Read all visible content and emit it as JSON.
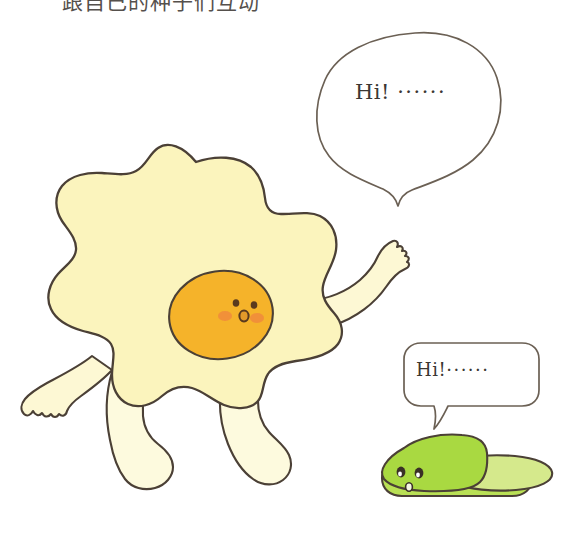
{
  "page": {
    "background_color": "#ffffff",
    "width": 581,
    "height": 534
  },
  "caption": {
    "text": "跟自己的种子们互动",
    "note": "clipped line of text along the very top edge, only the lower strokes are visible"
  },
  "speech_bubbles": [
    {
      "id": "big",
      "shape": "cloud-oval",
      "speaker": "fried-egg-character",
      "greeting": "Hi!",
      "dots": "······",
      "full_text": "Hi! ······",
      "outline_color": "#6b6054",
      "fill_color": "#ffffff",
      "tail_direction": "down"
    },
    {
      "id": "small",
      "shape": "rounded-rectangle",
      "speaker": "cucumber-character",
      "greeting": "Hi!",
      "dots": "······",
      "full_text": "Hi!······",
      "outline_color": "#6b6054",
      "fill_color": "#ffffff",
      "tail_direction": "down-left"
    }
  ],
  "characters": [
    {
      "id": "fried-egg",
      "name": "fried-egg-character",
      "parts": {
        "egg_white": "#fbf4bd",
        "egg_yolk": "#f5b32a",
        "legs": "#fdfade",
        "arms": "#fdf8d4",
        "outline": "#4b4036"
      },
      "face": {
        "eyes": "#5a3a1e",
        "mouth": "#5a3a1e",
        "blush": "#f08a3c",
        "expression": "surprised-o"
      },
      "pose": "walking, right arm raised waving"
    },
    {
      "id": "cucumber",
      "name": "cucumber-character",
      "parts": {
        "body_top": "#a9d941",
        "body_light": "#d5e98c",
        "body_bottom": "#b9e055",
        "outline": "#4b4036"
      },
      "face": {
        "eyes": "#3a3026",
        "eye_highlight": "#ffffff",
        "mouth": "#f4f6e4",
        "expression": "small-o"
      },
      "pose": "lying flat on the ground"
    }
  ],
  "colors": {
    "line": "#4b4036",
    "bubble_line": "#6b6054",
    "text": "#3b3733",
    "background": "#ffffff"
  }
}
